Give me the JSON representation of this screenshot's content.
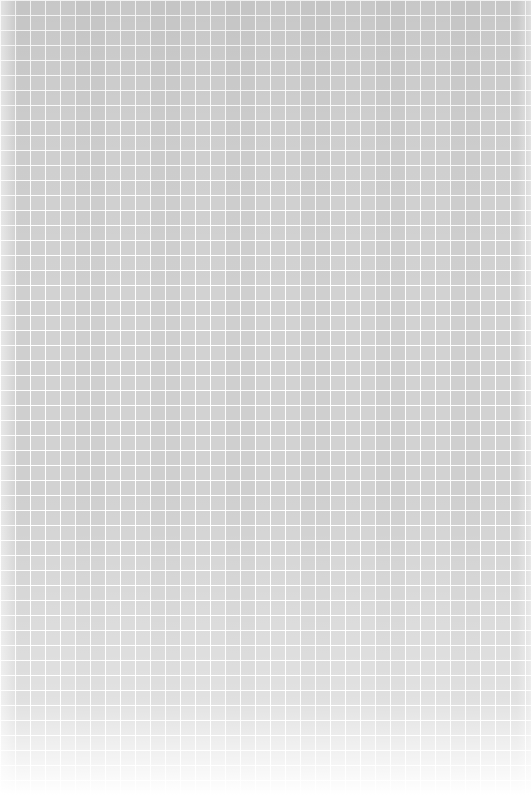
{
  "image": {
    "kind": "seamless-decorative-pattern",
    "subject": "repeating ornamental lattice texture",
    "description": "A seamless light gray decorative pattern made of a dense grid of small square tiles, each holding a symmetrical four-pointed diamond motif with corner accents, separated by thin white lines.",
    "width_px": 531,
    "height_px": 795,
    "orientation": "portrait",
    "has_text": "false",
    "has_ui_controls": "false"
  },
  "pattern": {
    "motif_name": "four-point-diamond-medallion",
    "tile_width_px": 15,
    "tile_height_px": 15,
    "tile_columns": 36,
    "tile_rows": 53,
    "grid_line_style": "white",
    "grid_line_width_px": 1,
    "symmetry": "four-fold radial within tile, square lattice repeat",
    "motif_elements": [
      "central diamond",
      "inner cross accent",
      "four corner squares",
      "square frame border"
    ]
  },
  "colors": {
    "background": "#fdfdfd",
    "tile_field": "#f2f2f2",
    "motif_light": "#e4e4e4",
    "motif_mid": "#d2d2d2",
    "motif_dark": "#bdbdbd",
    "grid_line": "#ffffff",
    "edge_fade": "#ffffff"
  },
  "tone": {
    "overall": "very light neutral gray",
    "lightest_region": "bottom edge",
    "darkest_region": "upper middle",
    "contrast": "low"
  }
}
